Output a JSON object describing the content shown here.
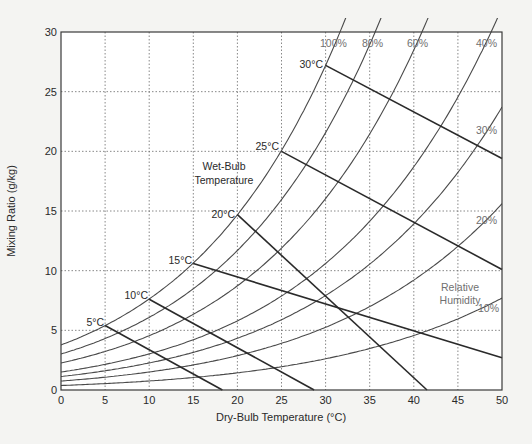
{
  "chart_data": {
    "type": "line",
    "title": "",
    "xlabel": "Dry-Bulb Temperature (°C)",
    "ylabel": "Mixing Ratio (g/kg)",
    "xlim": [
      0,
      50
    ],
    "ylim": [
      0,
      30
    ],
    "x_ticks": [
      0,
      5,
      10,
      15,
      20,
      25,
      30,
      35,
      40,
      45,
      50
    ],
    "y_ticks": [
      0,
      5,
      10,
      15,
      20,
      25,
      30
    ],
    "grid": true,
    "grid_style": "dotted",
    "relative_humidity_curves": [
      {
        "name": "100%",
        "rh": 100,
        "points": [
          [
            0,
            3.8
          ],
          [
            5,
            5.4
          ],
          [
            10,
            7.6
          ],
          [
            15,
            10.6
          ],
          [
            20,
            14.7
          ],
          [
            25,
            20.0
          ],
          [
            30,
            27.2
          ],
          [
            31.3,
            30
          ]
        ]
      },
      {
        "name": "80%",
        "rh": 80,
        "points": [
          [
            0,
            3.0
          ],
          [
            5,
            4.3
          ],
          [
            10,
            6.1
          ],
          [
            15,
            8.5
          ],
          [
            20,
            11.7
          ],
          [
            25,
            16.0
          ],
          [
            30,
            21.7
          ],
          [
            35,
            29.2
          ],
          [
            35.1,
            30
          ]
        ]
      },
      {
        "name": "60%",
        "rh": 60,
        "points": [
          [
            0,
            2.3
          ],
          [
            5,
            3.2
          ],
          [
            10,
            4.6
          ],
          [
            15,
            6.3
          ],
          [
            20,
            8.8
          ],
          [
            25,
            12.0
          ],
          [
            30,
            16.3
          ],
          [
            35,
            21.9
          ],
          [
            40,
            29.3
          ],
          [
            40.3,
            30
          ]
        ]
      },
      {
        "name": "40%",
        "rh": 40,
        "points": [
          [
            0,
            1.5
          ],
          [
            5,
            2.2
          ],
          [
            10,
            3.0
          ],
          [
            15,
            4.2
          ],
          [
            20,
            5.9
          ],
          [
            25,
            8.0
          ],
          [
            30,
            10.9
          ],
          [
            35,
            14.6
          ],
          [
            40,
            19.5
          ],
          [
            45,
            25.8
          ],
          [
            47.6,
            30
          ]
        ]
      },
      {
        "name": "30%",
        "rh": 30,
        "points": [
          [
            0,
            1.1
          ],
          [
            5,
            1.6
          ],
          [
            10,
            2.3
          ],
          [
            15,
            3.2
          ],
          [
            20,
            4.4
          ],
          [
            25,
            6.0
          ],
          [
            30,
            8.1
          ],
          [
            35,
            10.9
          ],
          [
            40,
            14.6
          ],
          [
            45,
            19.4
          ],
          [
            50,
            25.6
          ]
        ]
      },
      {
        "name": "20%",
        "rh": 20,
        "points": [
          [
            0,
            0.8
          ],
          [
            5,
            1.1
          ],
          [
            10,
            1.5
          ],
          [
            15,
            2.1
          ],
          [
            20,
            2.9
          ],
          [
            25,
            4.0
          ],
          [
            30,
            5.4
          ],
          [
            35,
            7.3
          ],
          [
            40,
            9.7
          ],
          [
            45,
            12.9
          ],
          [
            50,
            17.1
          ]
        ]
      },
      {
        "name": "10%",
        "rh": 10,
        "points": [
          [
            0,
            0.4
          ],
          [
            5,
            0.5
          ],
          [
            10,
            0.8
          ],
          [
            15,
            1.1
          ],
          [
            20,
            1.5
          ],
          [
            25,
            2.0
          ],
          [
            30,
            2.7
          ],
          [
            35,
            3.6
          ],
          [
            40,
            4.9
          ],
          [
            45,
            6.5
          ],
          [
            50,
            8.5
          ]
        ]
      }
    ],
    "wet_bulb_lines": [
      {
        "name": "5°C",
        "wb": 5,
        "start": [
          5,
          5.4
        ],
        "end": [
          18.3,
          0
        ]
      },
      {
        "name": "10°C",
        "wb": 10,
        "start": [
          10,
          7.6
        ],
        "end": [
          28.7,
          0
        ]
      },
      {
        "name": "15°C",
        "wb": 15,
        "start": [
          15,
          10.6
        ],
        "end": [
          50,
          2.7
        ]
      },
      {
        "name": "20°C",
        "wb": 20,
        "start": [
          20,
          14.7
        ],
        "end": [
          41.5,
          0
        ]
      },
      {
        "name": "25°C",
        "wb": 25,
        "start": [
          25,
          20.0
        ],
        "end": [
          50,
          10.1
        ]
      },
      {
        "name": "30°C",
        "wb": 30,
        "start": [
          30,
          27.2
        ],
        "end": [
          50,
          19.4
        ]
      }
    ],
    "annotations": [
      {
        "text": "Wet-Bulb Temperature",
        "x": 22,
        "y": 19.2
      },
      {
        "text": "Relative Humidity",
        "x": 45,
        "y": 7.2
      }
    ],
    "legend": null
  },
  "labels": {
    "x_axis": "Dry-Bulb Temperature (°C)",
    "y_axis": "Mixing Ratio (g/kg)",
    "wet_bulb_line1": "Wet-Bulb",
    "wet_bulb_line2": "Temperature",
    "rh_line1": "Relative",
    "rh_line2": "Humidity",
    "rh": [
      "100%",
      "80%",
      "60%",
      "40%",
      "30%",
      "20%",
      "10%"
    ],
    "wb": [
      "5°C",
      "10°C",
      "15°C",
      "20°C",
      "25°C",
      "30°C"
    ]
  },
  "colors": {
    "background": "#f4f4f2",
    "plot_background": "#ffffff",
    "rh_curve": "#4a4a4a",
    "wet_bulb_line": "#2a2a2a",
    "grid": "#6a6a6a",
    "frame": "#3a3a3a"
  }
}
